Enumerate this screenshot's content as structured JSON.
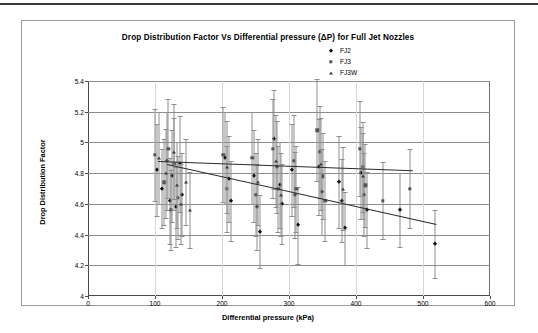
{
  "chart_data": {
    "type": "scatter",
    "title": "Drop Distribution Factor Vs Differential pressure (ΔP) for Full Jet Nozzles",
    "xlabel": "Differential pressure (kPa)",
    "ylabel": "Drop Distribution Factor",
    "xlim": [
      0,
      600
    ],
    "ylim": [
      4,
      5.4
    ],
    "xticks": [
      0,
      100,
      200,
      300,
      400,
      500,
      600
    ],
    "yticks": [
      4,
      4.2,
      4.4,
      4.6,
      4.8,
      5,
      5.2,
      5.4
    ],
    "xtick_labels": [
      "0",
      "100",
      "200",
      "300",
      "400",
      "500",
      "600"
    ],
    "ytick_labels": [
      "4",
      "4.2",
      "4.4",
      "4.6",
      "4.8",
      "5",
      "5.2",
      "5.4"
    ],
    "grid": "horizontal",
    "legend_position": "top-right",
    "error_bars": "vertical",
    "legend": [
      {
        "name": "FJ2",
        "marker": "diamond",
        "color": "#111111"
      },
      {
        "name": "FJ3",
        "marker": "square",
        "color": "#555555"
      },
      {
        "name": "FJ3W",
        "marker": "triangle",
        "color": "#3d3d3d"
      }
    ],
    "series": [
      {
        "name": "FJ2",
        "marker": "diamond",
        "points": [
          {
            "x": 103,
            "y": 4.82,
            "yerr": 0.3
          },
          {
            "x": 110,
            "y": 4.7,
            "yerr": 0.26
          },
          {
            "x": 118,
            "y": 4.88,
            "yerr": 0.32
          },
          {
            "x": 122,
            "y": 4.62,
            "yerr": 0.28
          },
          {
            "x": 126,
            "y": 4.78,
            "yerr": 0.3
          },
          {
            "x": 131,
            "y": 4.58,
            "yerr": 0.26
          },
          {
            "x": 137,
            "y": 4.86,
            "yerr": 0.31
          },
          {
            "x": 141,
            "y": 4.66,
            "yerr": 0.27
          },
          {
            "x": 205,
            "y": 4.9,
            "yerr": 0.3
          },
          {
            "x": 210,
            "y": 4.76,
            "yerr": 0.28
          },
          {
            "x": 214,
            "y": 4.62,
            "yerr": 0.26
          },
          {
            "x": 248,
            "y": 4.78,
            "yerr": 0.3
          },
          {
            "x": 252,
            "y": 4.58,
            "yerr": 0.28
          },
          {
            "x": 256,
            "y": 4.42,
            "yerr": 0.24
          },
          {
            "x": 278,
            "y": 5.02,
            "yerr": 0.32
          },
          {
            "x": 282,
            "y": 4.84,
            "yerr": 0.3
          },
          {
            "x": 286,
            "y": 4.72,
            "yerr": 0.28
          },
          {
            "x": 290,
            "y": 4.6,
            "yerr": 0.26
          },
          {
            "x": 305,
            "y": 4.82,
            "yerr": 0.3
          },
          {
            "x": 309,
            "y": 4.66,
            "yerr": 0.28
          },
          {
            "x": 313,
            "y": 4.46,
            "yerr": 0.25
          },
          {
            "x": 345,
            "y": 4.84,
            "yerr": 0.31
          },
          {
            "x": 349,
            "y": 4.68,
            "yerr": 0.28
          },
          {
            "x": 375,
            "y": 4.74,
            "yerr": 0.3
          },
          {
            "x": 379,
            "y": 4.62,
            "yerr": 0.27
          },
          {
            "x": 383,
            "y": 4.44,
            "yerr": 0.24
          },
          {
            "x": 408,
            "y": 4.8,
            "yerr": 0.3
          },
          {
            "x": 412,
            "y": 4.66,
            "yerr": 0.27
          },
          {
            "x": 416,
            "y": 4.56,
            "yerr": 0.25
          },
          {
            "x": 465,
            "y": 4.56,
            "yerr": 0.24
          },
          {
            "x": 518,
            "y": 4.34,
            "yerr": 0.22
          }
        ]
      },
      {
        "name": "FJ3",
        "marker": "square",
        "points": [
          {
            "x": 100,
            "y": 4.92,
            "yerr": 0.3
          },
          {
            "x": 114,
            "y": 4.74,
            "yerr": 0.28
          },
          {
            "x": 120,
            "y": 4.96,
            "yerr": 0.32
          },
          {
            "x": 124,
            "y": 4.56,
            "yerr": 0.26
          },
          {
            "x": 129,
            "y": 4.86,
            "yerr": 0.3
          },
          {
            "x": 134,
            "y": 4.64,
            "yerr": 0.27
          },
          {
            "x": 202,
            "y": 4.92,
            "yerr": 0.31
          },
          {
            "x": 207,
            "y": 4.7,
            "yerr": 0.28
          },
          {
            "x": 245,
            "y": 4.9,
            "yerr": 0.3
          },
          {
            "x": 250,
            "y": 4.66,
            "yerr": 0.27
          },
          {
            "x": 276,
            "y": 4.96,
            "yerr": 0.32
          },
          {
            "x": 284,
            "y": 4.7,
            "yerr": 0.28
          },
          {
            "x": 307,
            "y": 4.88,
            "yerr": 0.3
          },
          {
            "x": 311,
            "y": 4.7,
            "yerr": 0.28
          },
          {
            "x": 342,
            "y": 5.08,
            "yerr": 0.33
          },
          {
            "x": 346,
            "y": 4.94,
            "yerr": 0.3
          },
          {
            "x": 350,
            "y": 4.78,
            "yerr": 0.28
          },
          {
            "x": 354,
            "y": 4.62,
            "yerr": 0.26
          },
          {
            "x": 406,
            "y": 4.96,
            "yerr": 0.31
          },
          {
            "x": 410,
            "y": 4.84,
            "yerr": 0.29
          },
          {
            "x": 414,
            "y": 4.72,
            "yerr": 0.27
          },
          {
            "x": 440,
            "y": 4.62,
            "yerr": 0.25
          },
          {
            "x": 480,
            "y": 4.7,
            "yerr": 0.26
          }
        ]
      },
      {
        "name": "FJ3W",
        "marker": "triangle",
        "points": [
          {
            "x": 106,
            "y": 4.9,
            "yerr": 0.3
          },
          {
            "x": 116,
            "y": 4.8,
            "yerr": 0.29
          },
          {
            "x": 128,
            "y": 4.94,
            "yerr": 0.31
          },
          {
            "x": 133,
            "y": 4.72,
            "yerr": 0.28
          },
          {
            "x": 139,
            "y": 4.6,
            "yerr": 0.26
          },
          {
            "x": 146,
            "y": 4.74,
            "yerr": 0.28
          },
          {
            "x": 152,
            "y": 4.56,
            "yerr": 0.25
          },
          {
            "x": 208,
            "y": 4.84,
            "yerr": 0.3
          },
          {
            "x": 254,
            "y": 4.74,
            "yerr": 0.28
          },
          {
            "x": 280,
            "y": 4.88,
            "yerr": 0.3
          },
          {
            "x": 288,
            "y": 4.66,
            "yerr": 0.27
          },
          {
            "x": 348,
            "y": 4.86,
            "yerr": 0.3
          },
          {
            "x": 381,
            "y": 4.7,
            "yerr": 0.27
          },
          {
            "x": 411,
            "y": 4.78,
            "yerr": 0.28
          }
        ]
      }
    ],
    "trendlines": [
      {
        "name": "FJ2-FJ3 trend",
        "x0": 105,
        "y0": 4.88,
        "x1": 485,
        "y1": 4.82,
        "note": "upper near-flat fit"
      },
      {
        "name": "FJ3W trend",
        "x0": 118,
        "y0": 4.86,
        "x1": 520,
        "y1": 4.47,
        "note": "lower declining fit"
      }
    ]
  }
}
